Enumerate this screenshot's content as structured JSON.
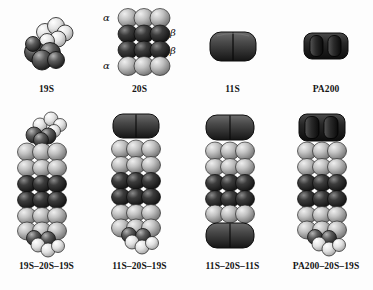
{
  "figure": {
    "background_color": "#fdfdfd"
  },
  "palette": {
    "alpha_ring": "#b8b8b8",
    "beta_ring": "#2f2f2f",
    "cap_19s_base": "#555555",
    "cap_19s_lid": "#dcdcdc",
    "cap_11s": "#3a3a3a",
    "cap_pa200": "#232323",
    "outline": "#1a1a1a",
    "text": "#151515"
  },
  "top_row": {
    "items": [
      {
        "id": "19s",
        "label": "19S",
        "kind": "regulatory-particle",
        "description": "cluster of spheres, dark base with lighter lid arc"
      },
      {
        "id": "20s",
        "label": "20S",
        "kind": "core-particle",
        "description": "four stacked rings",
        "rings": [
          "alpha",
          "beta",
          "beta",
          "alpha"
        ],
        "annotations": {
          "alpha_top": "α",
          "beta_upper": "β",
          "beta_lower": "β",
          "alpha_bottom": "α"
        }
      },
      {
        "id": "11s",
        "label": "11S",
        "kind": "regulatory-particle",
        "description": "dark rounded block with central vertical seam"
      },
      {
        "id": "pa200",
        "label": "PA200",
        "kind": "regulatory-particle",
        "description": "dark block with two vertical lobes"
      }
    ]
  },
  "bottom_row": {
    "items": [
      {
        "id": "19s-20s-19s",
        "label": "19S–20S–19S",
        "top_cap": "19S",
        "bottom_cap": "19S"
      },
      {
        "id": "11s-20s-19s",
        "label": "11S–20S–19S",
        "top_cap": "11S",
        "bottom_cap": "19S"
      },
      {
        "id": "11s-20s-11s",
        "label": "11S–20S–11S",
        "top_cap": "11S",
        "bottom_cap": "11S"
      },
      {
        "id": "pa200-20s-19s",
        "label": "PA200–20S–19S",
        "top_cap": "PA200",
        "bottom_cap": "19S"
      }
    ]
  }
}
